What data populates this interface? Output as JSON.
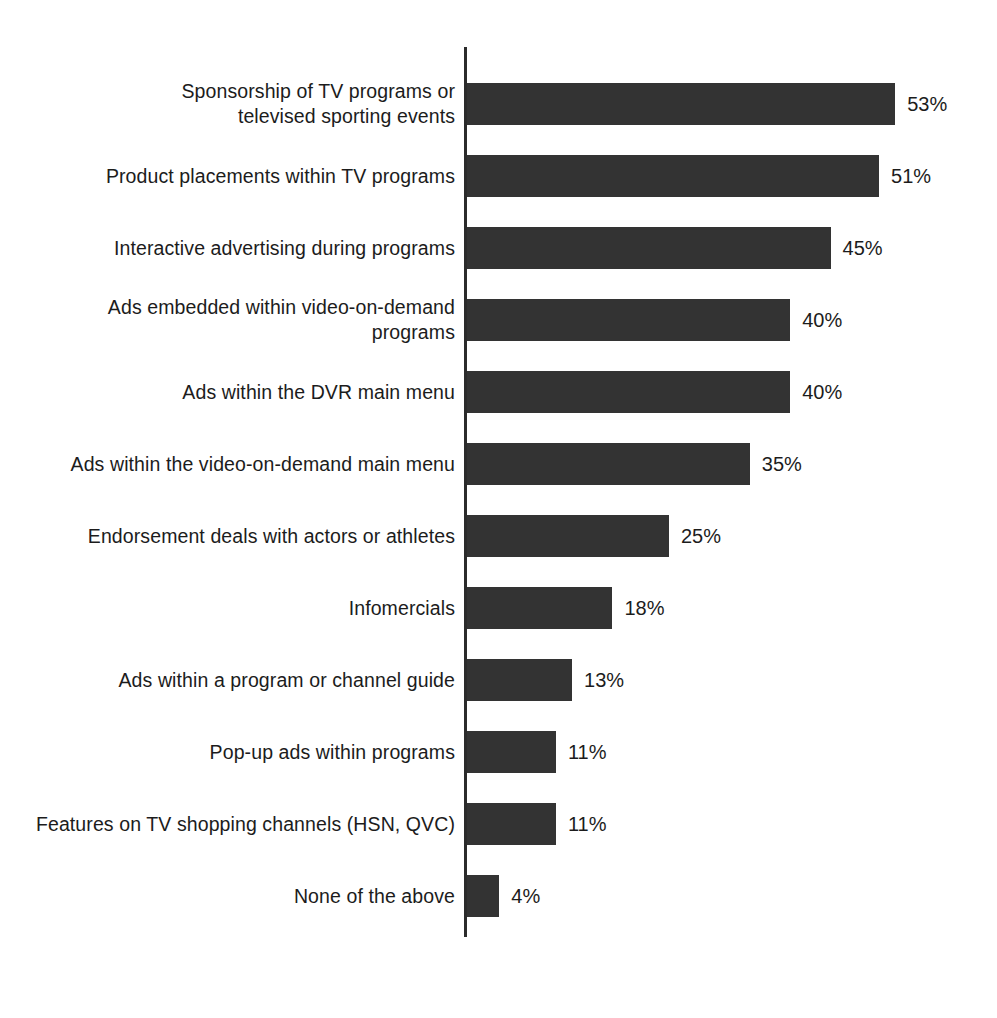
{
  "chart_data": {
    "type": "bar",
    "orientation": "horizontal",
    "title": "",
    "subtitle": "",
    "xlabel": "",
    "ylabel": "",
    "xlim": [
      0,
      53
    ],
    "grid": false,
    "legend": null,
    "value_suffix": "%",
    "bar_color": "#333333",
    "axis_color": "#2b2b2b",
    "text_color": "#1c1c1c",
    "background": "#ffffff",
    "categories": [
      "Sponsorship of TV programs or\ntelevised sporting events",
      "Product placements within TV programs",
      "Interactive advertising during programs",
      "Ads embedded within video-on-demand\nprograms",
      "Ads within the DVR main menu",
      "Ads within the video-on-demand main menu",
      "Endorsement deals with actors or athletes",
      "Infomercials",
      "Ads within a program or channel guide",
      "Pop-up ads within programs",
      "Features on TV shopping channels (HSN, QVC)",
      "None of the above"
    ],
    "values": [
      53,
      51,
      45,
      40,
      40,
      35,
      25,
      18,
      13,
      11,
      11,
      4
    ],
    "value_labels": [
      "53%",
      "51%",
      "45%",
      "40%",
      "40%",
      "35%",
      "25%",
      "18%",
      "13%",
      "11%",
      "11%",
      "4%"
    ]
  }
}
